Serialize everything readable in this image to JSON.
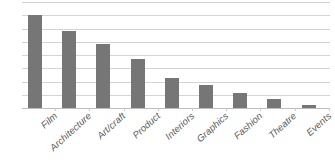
{
  "chart_data": {
    "type": "bar",
    "title": "",
    "subtitle": "",
    "xlabel": "",
    "ylabel": "",
    "categories": [
      "Film",
      "Architecture",
      "Art/craft",
      "Product",
      "Interiors",
      "Graphics",
      "Fashion",
      "Theatre",
      "Events"
    ],
    "values": [
      7.0,
      5.85,
      4.8,
      3.7,
      2.3,
      1.75,
      1.15,
      0.7,
      0.25
    ],
    "ylim": [
      0,
      8
    ],
    "y_tick_values": [
      0,
      1,
      2,
      3,
      4,
      5,
      6,
      7,
      8
    ],
    "y_tick_labels": [
      "",
      "",
      "",
      "",
      "",
      "",
      "",
      "",
      ""
    ],
    "gridlines": true,
    "grid_axis": "y",
    "legend": false,
    "legend_position": "none",
    "series": [
      {
        "name": "Count",
        "color": "#767676",
        "values": [
          7.0,
          5.85,
          4.8,
          3.7,
          2.3,
          1.75,
          1.15,
          0.7,
          0.25
        ]
      }
    ],
    "annotations": []
  },
  "style": {
    "bar_color": "#767676",
    "gridline_color": "#d4d4d4",
    "axis_color": "#bdbdbd",
    "label_color": "#5a5a5a",
    "background": "#ffffff"
  }
}
